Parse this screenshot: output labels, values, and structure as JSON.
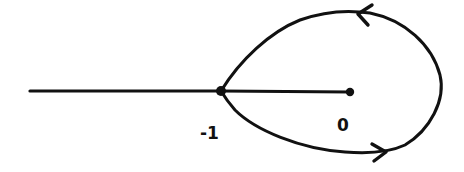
{
  "diagram": {
    "type": "root-locus-sketch",
    "colors": {
      "stroke": "#111111",
      "background": "#ffffff"
    },
    "points": [
      {
        "id": "minus-one",
        "label": "-1",
        "x": 221,
        "y": 91
      },
      {
        "id": "origin",
        "label": "0",
        "x": 350,
        "y": 92
      }
    ],
    "labels": {
      "minus_one": "-1",
      "origin": "0"
    },
    "segments": [
      {
        "id": "negative-real-axis",
        "from": [
          30,
          91
        ],
        "to": [
          221,
          91
        ]
      },
      {
        "id": "segment-minus-one-to-origin",
        "from": [
          221,
          91
        ],
        "to": [
          350,
          92
        ]
      }
    ],
    "loop": {
      "description": "teardrop-shaped closed contour starting and ending at -1, encircling origin",
      "direction": "clockwise (upper arc leftward, lower arc rightward)",
      "arrows": [
        {
          "id": "upper-arrow",
          "direction": "left",
          "x": 363,
          "y": 14
        },
        {
          "id": "lower-arrow",
          "direction": "right",
          "x": 382,
          "y": 152
        }
      ]
    }
  }
}
